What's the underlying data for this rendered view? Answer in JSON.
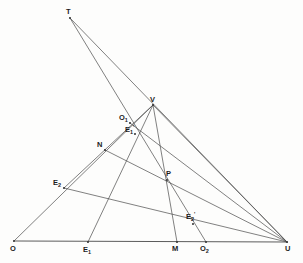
{
  "figure": {
    "background_color": "#fdfdfc",
    "line_color": "#4a4a4a",
    "label_color": "#1c1c1c",
    "width": 303,
    "height": 263
  },
  "points": [
    {
      "id": "T",
      "label": "T",
      "sub": "",
      "prime": "",
      "x": 70,
      "y": 18,
      "label_x": 66,
      "label_y": 8
    },
    {
      "id": "V",
      "label": "V",
      "sub": "",
      "prime": "",
      "x": 153,
      "y": 105,
      "label_x": 150,
      "label_y": 96
    },
    {
      "id": "O1",
      "label": "O",
      "sub": "1",
      "prime": "",
      "x": 130,
      "y": 123,
      "label_x": 119,
      "label_y": 114
    },
    {
      "id": "E1p",
      "label": "E",
      "sub": "1",
      "prime": "'",
      "x": 135,
      "y": 134,
      "label_x": 125,
      "label_y": 126
    },
    {
      "id": "N",
      "label": "N",
      "sub": "",
      "prime": "",
      "x": 105,
      "y": 150,
      "label_x": 97,
      "label_y": 141
    },
    {
      "id": "E2",
      "label": "E",
      "sub": "2",
      "prime": "",
      "x": 64,
      "y": 188,
      "label_x": 53,
      "label_y": 179
    },
    {
      "id": "P",
      "label": "P",
      "sub": "",
      "prime": "",
      "x": 167,
      "y": 180,
      "label_x": 166,
      "label_y": 170
    },
    {
      "id": "E2p",
      "label": "E",
      "sub": "2",
      "prime": "'",
      "x": 193,
      "y": 224,
      "label_x": 186,
      "label_y": 213
    },
    {
      "id": "O",
      "label": "O",
      "sub": "",
      "prime": "",
      "x": 14,
      "y": 241,
      "label_x": 10,
      "label_y": 245
    },
    {
      "id": "E1",
      "label": "E",
      "sub": "1",
      "prime": "",
      "x": 88,
      "y": 242,
      "label_x": 83,
      "label_y": 246
    },
    {
      "id": "M",
      "label": "M",
      "sub": "",
      "prime": "",
      "x": 177,
      "y": 242,
      "label_x": 172,
      "label_y": 245
    },
    {
      "id": "O2",
      "label": "O",
      "sub": "2",
      "prime": "",
      "x": 206,
      "y": 242,
      "label_x": 200,
      "label_y": 245
    },
    {
      "id": "U",
      "label": "U",
      "sub": "",
      "prime": "",
      "x": 287,
      "y": 242,
      "label_x": 285,
      "label_y": 245
    }
  ],
  "segments": [
    {
      "name": "baseline-O-U",
      "x1": 14,
      "y1": 241,
      "x2": 287,
      "y2": 242,
      "thick": true
    },
    {
      "name": "T-to-U-through-V",
      "x1": 70,
      "y1": 18,
      "x2": 287,
      "y2": 242,
      "thick": false
    },
    {
      "name": "T-to-O2",
      "x1": 70,
      "y1": 18,
      "x2": 206,
      "y2": 242,
      "thick": false
    },
    {
      "name": "O-to-V",
      "x1": 14,
      "y1": 241,
      "x2": 153,
      "y2": 105,
      "thick": false
    },
    {
      "name": "V-to-E1",
      "x1": 153,
      "y1": 105,
      "x2": 88,
      "y2": 242,
      "thick": false
    },
    {
      "name": "V-to-M",
      "x1": 153,
      "y1": 105,
      "x2": 177,
      "y2": 242,
      "thick": false
    },
    {
      "name": "V-to-U",
      "x1": 153,
      "y1": 105,
      "x2": 287,
      "y2": 242,
      "thick": false
    },
    {
      "name": "N-to-U-through-P",
      "x1": 105,
      "y1": 150,
      "x2": 287,
      "y2": 242,
      "thick": false
    },
    {
      "name": "E2-to-U-through-E2prime",
      "x1": 64,
      "y1": 188,
      "x2": 287,
      "y2": 242,
      "thick": false
    },
    {
      "name": "E2-to-V",
      "x1": 64,
      "y1": 188,
      "x2": 153,
      "y2": 105,
      "thick": false
    },
    {
      "name": "O1-to-U",
      "x1": 130,
      "y1": 123,
      "x2": 287,
      "y2": 242,
      "thick": false
    }
  ],
  "caption": ""
}
